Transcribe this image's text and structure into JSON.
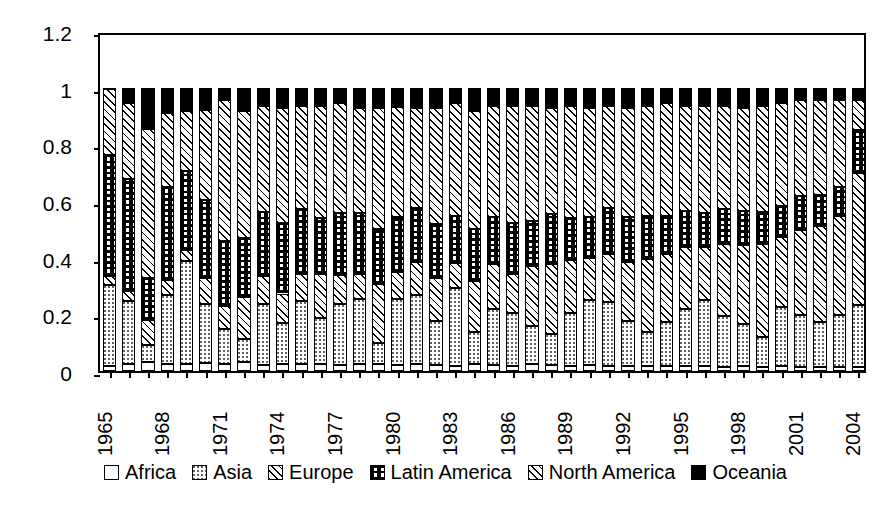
{
  "chart_data": {
    "type": "bar",
    "subtype": "stacked-100-percent",
    "title": "",
    "xlabel": "",
    "ylabel": "",
    "ylim": [
      0,
      1.2
    ],
    "y_ticks": [
      "0",
      "0.2",
      "0.4",
      "0.6",
      "0.8",
      "1",
      "1.2"
    ],
    "y_tick_values": [
      0,
      0.2,
      0.4,
      0.6,
      0.8,
      1,
      1.2
    ],
    "grid": false,
    "legend_position": "bottom",
    "x_label_interval": 3,
    "categories": [
      "1965",
      "1966",
      "1967",
      "1968",
      "1969",
      "1970",
      "1971",
      "1972",
      "1973",
      "1974",
      "1975",
      "1976",
      "1977",
      "1978",
      "1979",
      "1980",
      "1981",
      "1982",
      "1983",
      "1984",
      "1985",
      "1986",
      "1987",
      "1988",
      "1989",
      "1990",
      "1991",
      "1992",
      "1993",
      "1994",
      "1995",
      "1996",
      "1997",
      "1998",
      "1999",
      "2000",
      "2001",
      "2002",
      "2003",
      "2004"
    ],
    "x_tick_labels": [
      "1965",
      "",
      "",
      "1968",
      "",
      "",
      "1971",
      "",
      "",
      "1974",
      "",
      "",
      "1977",
      "",
      "",
      "1980",
      "",
      "",
      "1983",
      "",
      "",
      "1986",
      "",
      "",
      "1989",
      "",
      "",
      "1992",
      "",
      "",
      "1995",
      "",
      "",
      "1998",
      "",
      "",
      "2001",
      "",
      "",
      "2004"
    ],
    "series": [
      {
        "name": "Africa",
        "pattern": "p-africa",
        "values": [
          0.016,
          0.02,
          0.028,
          0.02,
          0.022,
          0.026,
          0.022,
          0.03,
          0.018,
          0.022,
          0.022,
          0.02,
          0.018,
          0.022,
          0.02,
          0.018,
          0.02,
          0.018,
          0.016,
          0.02,
          0.018,
          0.016,
          0.02,
          0.018,
          0.016,
          0.018,
          0.016,
          0.014,
          0.016,
          0.014,
          0.016,
          0.014,
          0.012,
          0.014,
          0.012,
          0.014,
          0.012,
          0.012,
          0.012,
          0.012
        ]
      },
      {
        "name": "Asia",
        "pattern": "p-asia",
        "values": [
          0.285,
          0.225,
          0.06,
          0.245,
          0.365,
          0.21,
          0.125,
          0.08,
          0.215,
          0.145,
          0.225,
          0.165,
          0.215,
          0.23,
          0.075,
          0.235,
          0.245,
          0.155,
          0.275,
          0.115,
          0.2,
          0.185,
          0.135,
          0.11,
          0.185,
          0.23,
          0.225,
          0.16,
          0.12,
          0.155,
          0.2,
          0.235,
          0.18,
          0.15,
          0.105,
          0.21,
          0.185,
          0.16,
          0.185,
          0.22
        ]
      },
      {
        "name": "Europe",
        "pattern": "p-europe",
        "values": [
          0.032,
          0.035,
          0.09,
          0.055,
          0.04,
          0.09,
          0.08,
          0.15,
          0.1,
          0.105,
          0.095,
          0.155,
          0.105,
          0.09,
          0.21,
          0.095,
          0.12,
          0.155,
          0.09,
          0.18,
          0.16,
          0.14,
          0.215,
          0.25,
          0.19,
          0.15,
          0.17,
          0.21,
          0.26,
          0.245,
          0.22,
          0.19,
          0.255,
          0.28,
          0.33,
          0.25,
          0.3,
          0.34,
          0.35,
          0.47
        ]
      },
      {
        "name": "Latin America",
        "pattern": "p-latin",
        "values": [
          0.43,
          0.4,
          0.15,
          0.33,
          0.28,
          0.28,
          0.23,
          0.21,
          0.23,
          0.25,
          0.23,
          0.2,
          0.22,
          0.215,
          0.195,
          0.195,
          0.19,
          0.19,
          0.165,
          0.185,
          0.165,
          0.18,
          0.16,
          0.175,
          0.15,
          0.145,
          0.165,
          0.16,
          0.15,
          0.135,
          0.13,
          0.12,
          0.125,
          0.12,
          0.115,
          0.11,
          0.12,
          0.11,
          0.105,
          0.15
        ]
      },
      {
        "name": "North America",
        "pattern": "p-north",
        "values": [
          0.237,
          0.27,
          0.53,
          0.265,
          0.215,
          0.32,
          0.503,
          0.45,
          0.377,
          0.408,
          0.368,
          0.4,
          0.392,
          0.373,
          0.43,
          0.392,
          0.355,
          0.412,
          0.404,
          0.42,
          0.397,
          0.419,
          0.41,
          0.377,
          0.399,
          0.387,
          0.364,
          0.386,
          0.394,
          0.401,
          0.374,
          0.381,
          0.368,
          0.366,
          0.378,
          0.366,
          0.343,
          0.338,
          0.308,
          0.108
        ]
      },
      {
        "name": "Oceania",
        "pattern": "p-oceania",
        "values": [
          0.0,
          0.05,
          0.142,
          0.085,
          0.078,
          0.074,
          0.04,
          0.08,
          0.06,
          0.07,
          0.06,
          0.06,
          0.05,
          0.07,
          0.07,
          0.065,
          0.07,
          0.07,
          0.05,
          0.08,
          0.06,
          0.06,
          0.06,
          0.07,
          0.06,
          0.07,
          0.06,
          0.07,
          0.06,
          0.05,
          0.06,
          0.06,
          0.06,
          0.07,
          0.06,
          0.05,
          0.04,
          0.04,
          0.04,
          0.04
        ]
      }
    ]
  },
  "legend": {
    "items": [
      {
        "label": "Africa"
      },
      {
        "label": "Asia"
      },
      {
        "label": "Europe"
      },
      {
        "label": "Latin America"
      },
      {
        "label": "North America"
      },
      {
        "label": "Oceania"
      }
    ]
  },
  "colors": {
    "line": "#000000",
    "background": "#ffffff",
    "oceania_fill": "#000000"
  }
}
